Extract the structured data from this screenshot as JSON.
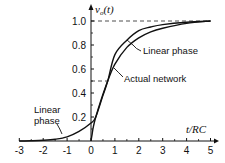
{
  "chart_data": {
    "type": "line",
    "title": "",
    "xlabel": "t/RC",
    "ylabel": "v_o(t)",
    "xlim": [
      -3,
      5
    ],
    "ylim": [
      0,
      1.0
    ],
    "grid": false,
    "legend": "none (curves labeled by annotations)",
    "x_ticks": [
      -3,
      -2,
      -1,
      0,
      1,
      2,
      3,
      4,
      5
    ],
    "x_tick_labels": [
      "-3",
      "-2",
      "-1",
      "0",
      "1",
      "2",
      "3",
      "4",
      "5"
    ],
    "y_ticks": [
      0.2,
      0.4,
      0.6,
      0.8,
      1.0
    ],
    "y_tick_labels": [
      "0.2",
      "0.4",
      "0.6",
      "0.8",
      "1.0"
    ],
    "reference_lines": [
      {
        "orientation": "horizontal",
        "y": 1.0,
        "style": "dashed",
        "x_range": [
          0,
          5
        ]
      },
      {
        "orientation": "horizontal",
        "y": 0.5,
        "style": "dashed",
        "x_range": [
          0,
          0.7
        ]
      }
    ],
    "series": [
      {
        "name": "Linear phase",
        "x": [
          -3,
          -2.5,
          -2,
          -1.5,
          -1,
          -0.5,
          0,
          0.2,
          0.5,
          0.7,
          1,
          1.5,
          2,
          2.5,
          3,
          4,
          5
        ],
        "values": [
          0,
          0.002,
          0.006,
          0.015,
          0.035,
          0.08,
          0.15,
          0.2,
          0.38,
          0.5,
          0.72,
          0.84,
          0.92,
          0.95,
          0.97,
          0.99,
          1.0
        ]
      },
      {
        "name": "Actual network",
        "x": [
          0,
          0.05,
          0.1,
          0.2,
          0.4,
          0.7,
          1,
          1.5,
          2,
          2.5,
          3,
          4,
          5
        ],
        "values": [
          0,
          0.06,
          0.12,
          0.2,
          0.33,
          0.5,
          0.64,
          0.78,
          0.86,
          0.91,
          0.94,
          0.98,
          1.0
        ]
      }
    ],
    "annotations": [
      {
        "text": "Linear phase",
        "target_series": "Linear phase",
        "position": "upper right",
        "points_to_x": 1.6
      },
      {
        "text": "Actual network",
        "target_series": "Actual network",
        "position": "middle right",
        "points_to_x": 1.0
      },
      {
        "text": "Linear phase",
        "target_series": "Linear phase",
        "position": "lower left",
        "points_to_x": -1.2,
        "lines": [
          "Linear",
          "phase"
        ]
      }
    ]
  },
  "labels": {
    "y_axis": "v",
    "y_axis_sub": "o",
    "y_axis_arg": "(t)",
    "x_axis": "t/RC",
    "annot_linear_upper": "Linear phase",
    "annot_actual": "Actual network",
    "annot_linear_lower_1": "Linear",
    "annot_linear_lower_2": "phase"
  }
}
